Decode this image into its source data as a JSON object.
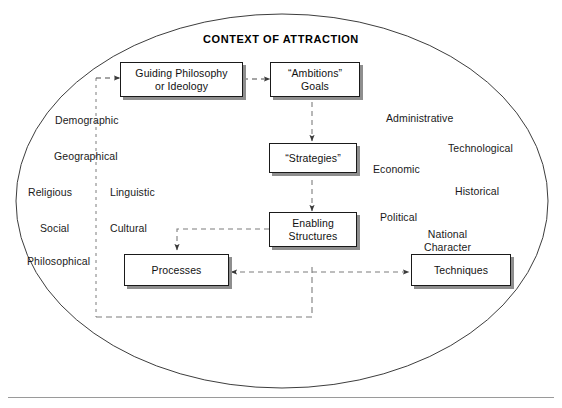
{
  "diagram": {
    "title": "CONTEXT OF ATTRACTION",
    "boundary_shape_name": "ellipse",
    "colors": {
      "box_border": "#1a1a1a",
      "box_fill": "#ffffff",
      "box_shadow": "#8e8e8e",
      "connector": "#4d4d4d",
      "ellipse": "#333333",
      "rule": "#999999",
      "text": "#1a1a1a"
    },
    "nodes": [
      {
        "id": "guiding-philosophy",
        "line1": "Guiding Philosophy",
        "line2": "or Ideology"
      },
      {
        "id": "ambitions-goals",
        "line1": "“Ambitions”",
        "line2": "Goals"
      },
      {
        "id": "strategies",
        "line1": "“Strategies”",
        "line2": ""
      },
      {
        "id": "enabling-structures",
        "line1": "Enabling",
        "line2": "Structures"
      },
      {
        "id": "processes",
        "line1": "Processes",
        "line2": ""
      },
      {
        "id": "techniques",
        "line1": "Techniques",
        "line2": ""
      }
    ],
    "context_words_left": [
      {
        "id": "demographic",
        "label": "Demographic"
      },
      {
        "id": "geographical",
        "label": "Geographical"
      },
      {
        "id": "religious",
        "label": "Religious"
      },
      {
        "id": "linguistic",
        "label": "Linguistic"
      },
      {
        "id": "social",
        "label": "Social"
      },
      {
        "id": "cultural",
        "label": "Cultural"
      },
      {
        "id": "philosophical",
        "label": "Philosophical"
      }
    ],
    "context_words_right": [
      {
        "id": "administrative",
        "label": "Administrative"
      },
      {
        "id": "technological",
        "label": "Technological"
      },
      {
        "id": "economic",
        "label": "Economic"
      },
      {
        "id": "historical",
        "label": "Historical"
      },
      {
        "id": "political",
        "label": "Political"
      },
      {
        "id": "national-character",
        "label": "National\nCharacter"
      }
    ],
    "connectors": [
      {
        "id": "feedback-to-guiding-philosophy",
        "style": "dashed",
        "arrow": "single"
      },
      {
        "id": "guiding-philosophy-to-ambitions",
        "style": "dashed",
        "arrow": "single"
      },
      {
        "id": "ambitions-to-strategies",
        "style": "dashed",
        "arrow": "single"
      },
      {
        "id": "strategies-to-enabling-structures",
        "style": "dashed",
        "arrow": "single"
      },
      {
        "id": "enabling-structures-to-processes",
        "style": "dashed",
        "arrow": "single"
      },
      {
        "id": "processes-techniques",
        "style": "dashed",
        "arrow": "double"
      },
      {
        "id": "feedback-loop-path",
        "style": "dashed",
        "arrow": "none"
      },
      {
        "id": "left-vertical-divider",
        "style": "dashed",
        "arrow": "none"
      }
    ]
  }
}
